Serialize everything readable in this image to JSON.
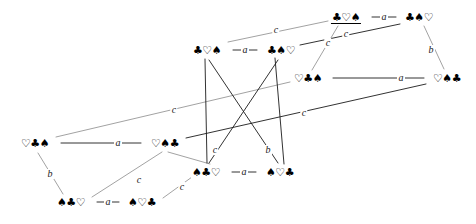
{
  "figure": {
    "kind": "cayley-graph",
    "background_color": "#ffffff",
    "line_color": "#222222",
    "text_color": "#000000"
  },
  "glyphs": {
    "club": "♣",
    "spade": "♠",
    "heart": "♡"
  },
  "nodes": [
    {
      "id": "n1",
      "label": "♣♡♠",
      "x": 346,
      "y": 17,
      "underlined": true
    },
    {
      "id": "n2",
      "label": "♣♠♡",
      "x": 419,
      "y": 17,
      "underlined": false
    },
    {
      "id": "n3",
      "label": "♣♡♠",
      "x": 207,
      "y": 50,
      "underlined": false
    },
    {
      "id": "n4",
      "label": "♣♠♡",
      "x": 281,
      "y": 50,
      "underlined": false
    },
    {
      "id": "n5",
      "label": "♡♣♠",
      "x": 308,
      "y": 78,
      "underlined": false
    },
    {
      "id": "n6",
      "label": "♡♠♣",
      "x": 447,
      "y": 78,
      "underlined": false
    },
    {
      "id": "n7",
      "label": "♡♣♠",
      "x": 35,
      "y": 143,
      "underlined": false
    },
    {
      "id": "n8",
      "label": "♡♠♣",
      "x": 165,
      "y": 143,
      "underlined": false
    },
    {
      "id": "n9",
      "label": "♠♣♡",
      "x": 206,
      "y": 172,
      "underlined": false
    },
    {
      "id": "n10",
      "label": "♠♡♣",
      "x": 280,
      "y": 172,
      "underlined": false
    },
    {
      "id": "n11",
      "label": "♠♣♡",
      "x": 71,
      "y": 202,
      "underlined": false
    },
    {
      "id": "n12",
      "label": "♠♡♣",
      "x": 142,
      "y": 202,
      "underlined": false
    }
  ],
  "edges": [
    {
      "id": "e1",
      "from": "n1",
      "to": "n2",
      "label": "a",
      "x1": 372,
      "y1": 17,
      "x2": 396,
      "y2": 17,
      "lx": 384,
      "ly": 17,
      "weight": 1.0
    },
    {
      "id": "e2",
      "from": "n3",
      "to": "n4",
      "label": "a",
      "x1": 233,
      "y1": 50,
      "x2": 257,
      "y2": 50,
      "lx": 245,
      "ly": 50,
      "weight": 1.0
    },
    {
      "id": "e3",
      "from": "n5",
      "to": "n6",
      "label": "a",
      "x1": 333,
      "y1": 78,
      "x2": 424,
      "y2": 78,
      "lx": 401,
      "ly": 78,
      "weight": 1.0
    },
    {
      "id": "e4",
      "from": "n7",
      "to": "n8",
      "label": "a",
      "x1": 61,
      "y1": 143,
      "x2": 141,
      "y2": 143,
      "lx": 118,
      "ly": 143,
      "weight": 1.0
    },
    {
      "id": "e5",
      "from": "n9",
      "to": "n10",
      "label": "a",
      "x1": 232,
      "y1": 172,
      "x2": 256,
      "y2": 172,
      "lx": 244,
      "ly": 172,
      "weight": 1.0
    },
    {
      "id": "e6",
      "from": "n11",
      "to": "n12",
      "label": "a",
      "x1": 97,
      "y1": 202,
      "x2": 119,
      "y2": 202,
      "lx": 108,
      "ly": 202,
      "weight": 1.0
    },
    {
      "id": "e7",
      "from": "n2",
      "to": "n6",
      "label": "b",
      "x1": 424,
      "y1": 26,
      "x2": 444,
      "y2": 69,
      "lx": 431,
      "ly": 50,
      "weight": 0.9
    },
    {
      "id": "e8",
      "from": "n7",
      "to": "n11",
      "label": "b",
      "x1": 38,
      "y1": 153,
      "x2": 63,
      "y2": 194,
      "lx": 50,
      "ly": 174,
      "weight": 0.9
    },
    {
      "id": "e9",
      "from": "n3",
      "to": "n1",
      "label": "c",
      "x1": 228,
      "y1": 42,
      "x2": 328,
      "y2": 21,
      "lx": 276,
      "ly": 30,
      "weight": 0.7
    },
    {
      "id": "e10",
      "from": "n4",
      "to": "n2",
      "label": "c",
      "x1": 300,
      "y1": 45,
      "x2": 400,
      "y2": 24,
      "lx": 346,
      "ly": 34,
      "weight": 1.0
    },
    {
      "id": "e11",
      "from": "n5",
      "to": "n1",
      "label": "c",
      "x1": 312,
      "y1": 70,
      "x2": 338,
      "y2": 26,
      "lx": 328,
      "ly": 43,
      "weight": 0.7
    },
    {
      "id": "e12",
      "from": "n7",
      "to": "n5",
      "label": "c",
      "x1": 56,
      "y1": 137,
      "x2": 290,
      "y2": 82,
      "lx": 174,
      "ly": 110,
      "weight": 0.7
    },
    {
      "id": "e13",
      "from": "n8",
      "to": "n6",
      "label": "c",
      "x1": 186,
      "y1": 138,
      "x2": 426,
      "y2": 84,
      "lx": 304,
      "ly": 113,
      "weight": 1.0
    },
    {
      "id": "e14",
      "from": "n9",
      "to": "n8",
      "label": "c",
      "x1": 210,
      "y1": 164,
      "x2": 168,
      "y2": 152,
      "lx": 215,
      "ly": 150,
      "weight": 0.9
    },
    {
      "id": "e15",
      "from": "n10",
      "to": "n4",
      "label": "b",
      "x1": 284,
      "y1": 164,
      "x2": 275,
      "y2": 58,
      "lx": 268,
      "ly": 150,
      "weight": 1.0
    },
    {
      "id": "e16",
      "from": "n11",
      "to": "n8",
      "label": "c",
      "x1": 92,
      "y1": 197,
      "x2": 162,
      "y2": 152,
      "lx": 139,
      "ly": 180,
      "weight": 0.7
    },
    {
      "id": "e17",
      "from": "n12",
      "to": "n9",
      "label": "c",
      "x1": 163,
      "y1": 198,
      "x2": 192,
      "y2": 177,
      "lx": 182,
      "ly": 187,
      "weight": 0.7
    },
    {
      "id": "e18",
      "from": "n9",
      "to": "n3",
      "label": "",
      "x1": 207,
      "y1": 163,
      "x2": 205,
      "y2": 59,
      "lx": 0,
      "ly": 0,
      "weight": 1.0
    }
  ],
  "long_diagonals": [
    {
      "id": "d1",
      "from": "n3",
      "to": "n10",
      "x1": 209,
      "y1": 60,
      "x2": 278,
      "y2": 163,
      "weight": 1.0
    },
    {
      "id": "d2",
      "from": "n4",
      "to": "n9",
      "x1": 278,
      "y1": 60,
      "x2": 209,
      "y2": 163,
      "weight": 1.0
    }
  ],
  "edge_labels_legend": [
    "a",
    "b",
    "c"
  ]
}
